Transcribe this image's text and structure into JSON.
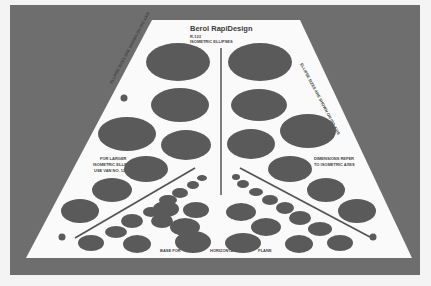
{
  "photo": {
    "subject": "isometric ellipse drafting template",
    "background_color": "#6e6e6e",
    "template_color": "#fafafa",
    "ellipse_color": "#5a5a5a"
  },
  "template": {
    "brand": "Berol RapiDesign",
    "model": "R-123",
    "title": "ISOMETRIC ELLIPSES",
    "note_left_top": "ELLIPSE SIZES ARE SHOWN ON ISO AXIS",
    "note_right_top": "ELLIPSE SIZES ARE SHOWN ON ISO AXIS",
    "note_left": [
      "FOR LARGER",
      "ISOMETRIC ELLIPSES",
      "USE VAN NO. 124"
    ],
    "note_right": [
      "DIMENSIONS REFER",
      "TO ISOMETRIC AXES"
    ],
    "bottom_labels": [
      "BASE FOR",
      "HORIZONTAL",
      "PLANE"
    ]
  }
}
